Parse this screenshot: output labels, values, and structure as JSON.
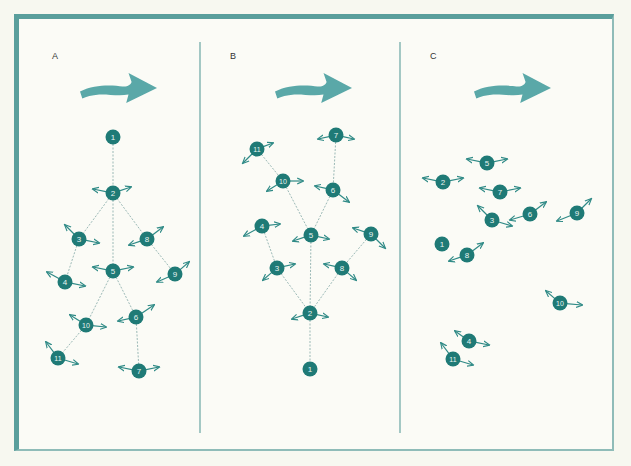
{
  "colors": {
    "frame": "#5a9f9c",
    "divider": "#6aa6a3",
    "flow_arrow": "#5aa8a8",
    "node": "#1f7a76",
    "node_text": "#e8f4f2",
    "edge": "#9bb9b6",
    "vector": "#2f8a86"
  },
  "panels": [
    {
      "label": "A",
      "label_pos": [
        52,
        51
      ],
      "flow_arrow": {
        "x": 80,
        "y": 73,
        "w": 77,
        "h": 30
      },
      "nodes": [
        {
          "id": "1",
          "x": 113,
          "y": 137,
          "arrows": []
        },
        {
          "id": "2",
          "x": 113,
          "y": 193,
          "arrows": [
            [
              -20,
              -4
            ],
            [
              18,
              -6
            ]
          ]
        },
        {
          "id": "3",
          "x": 79,
          "y": 239,
          "arrows": [
            [
              -14,
              -14
            ],
            [
              20,
              4
            ]
          ]
        },
        {
          "id": "8",
          "x": 147,
          "y": 239,
          "arrows": [
            [
              16,
              -12
            ],
            [
              -18,
              6
            ]
          ]
        },
        {
          "id": "5",
          "x": 113,
          "y": 271,
          "arrows": [
            [
              -20,
              -4
            ],
            [
              20,
              -4
            ]
          ]
        },
        {
          "id": "4",
          "x": 65,
          "y": 282,
          "arrows": [
            [
              -18,
              -10
            ],
            [
              20,
              4
            ]
          ]
        },
        {
          "id": "9",
          "x": 175,
          "y": 274,
          "arrows": [
            [
              14,
              -12
            ],
            [
              -18,
              8
            ]
          ]
        },
        {
          "id": "10",
          "x": 86,
          "y": 325,
          "arrows": [
            [
              -16,
              -10
            ],
            [
              20,
              2
            ]
          ]
        },
        {
          "id": "6",
          "x": 136,
          "y": 317,
          "arrows": [
            [
              18,
              -12
            ],
            [
              -18,
              4
            ]
          ]
        },
        {
          "id": "11",
          "x": 58,
          "y": 358,
          "arrows": [
            [
              -12,
              -16
            ],
            [
              20,
              6
            ]
          ]
        },
        {
          "id": "7",
          "x": 139,
          "y": 371,
          "arrows": [
            [
              -20,
              -4
            ],
            [
              20,
              -4
            ]
          ]
        }
      ],
      "edges": [
        [
          "1",
          "2"
        ],
        [
          "2",
          "3"
        ],
        [
          "2",
          "8"
        ],
        [
          "2",
          "5"
        ],
        [
          "3",
          "4"
        ],
        [
          "8",
          "9"
        ],
        [
          "5",
          "10"
        ],
        [
          "5",
          "6"
        ],
        [
          "10",
          "11"
        ],
        [
          "6",
          "7"
        ]
      ]
    },
    {
      "label": "B",
      "label_pos": [
        230,
        51
      ],
      "flow_arrow": {
        "x": 275,
        "y": 73,
        "w": 77,
        "h": 30
      },
      "nodes": [
        {
          "id": "7",
          "x": 336,
          "y": 135,
          "arrows": [
            [
              -18,
              4
            ],
            [
              18,
              4
            ]
          ]
        },
        {
          "id": "11",
          "x": 257,
          "y": 149,
          "arrows": [
            [
              16,
              -6
            ],
            [
              -14,
              14
            ]
          ]
        },
        {
          "id": "10",
          "x": 283,
          "y": 181,
          "arrows": [
            [
              20,
              0
            ],
            [
              -16,
              10
            ]
          ]
        },
        {
          "id": "6",
          "x": 333,
          "y": 190,
          "arrows": [
            [
              -18,
              -4
            ],
            [
              16,
              12
            ]
          ]
        },
        {
          "id": "4",
          "x": 262,
          "y": 226,
          "arrows": [
            [
              18,
              -2
            ],
            [
              -18,
              10
            ]
          ]
        },
        {
          "id": "5",
          "x": 311,
          "y": 235,
          "arrows": [
            [
              -18,
              6
            ],
            [
              18,
              4
            ]
          ]
        },
        {
          "id": "9",
          "x": 371,
          "y": 234,
          "arrows": [
            [
              -18,
              -6
            ],
            [
              14,
              14
            ]
          ]
        },
        {
          "id": "3",
          "x": 277,
          "y": 268,
          "arrows": [
            [
              18,
              -4
            ],
            [
              -14,
              12
            ]
          ]
        },
        {
          "id": "8",
          "x": 342,
          "y": 268,
          "arrows": [
            [
              -18,
              -4
            ],
            [
              14,
              12
            ]
          ]
        },
        {
          "id": "2",
          "x": 310,
          "y": 313,
          "arrows": [
            [
              -18,
              6
            ],
            [
              18,
              4
            ]
          ]
        },
        {
          "id": "1",
          "x": 310,
          "y": 369,
          "arrows": []
        }
      ],
      "edges": [
        [
          "7",
          "6"
        ],
        [
          "11",
          "10"
        ],
        [
          "10",
          "5"
        ],
        [
          "6",
          "5"
        ],
        [
          "4",
          "3"
        ],
        [
          "9",
          "8"
        ],
        [
          "5",
          "2"
        ],
        [
          "3",
          "2"
        ],
        [
          "8",
          "2"
        ],
        [
          "2",
          "1"
        ]
      ]
    },
    {
      "label": "C",
      "label_pos": [
        430,
        51
      ],
      "flow_arrow": {
        "x": 474,
        "y": 73,
        "w": 77,
        "h": 30
      },
      "nodes": [
        {
          "id": "5",
          "x": 487,
          "y": 163,
          "arrows": [
            [
              -20,
              -4
            ],
            [
              20,
              -4
            ]
          ]
        },
        {
          "id": "2",
          "x": 443,
          "y": 182,
          "arrows": [
            [
              -20,
              -4
            ],
            [
              20,
              -4
            ]
          ]
        },
        {
          "id": "7",
          "x": 500,
          "y": 192,
          "arrows": [
            [
              -20,
              -4
            ],
            [
              20,
              -4
            ]
          ]
        },
        {
          "id": "3",
          "x": 492,
          "y": 220,
          "arrows": [
            [
              -14,
              -14
            ],
            [
              20,
              6
            ]
          ]
        },
        {
          "id": "6",
          "x": 530,
          "y": 214,
          "arrows": [
            [
              -20,
              6
            ],
            [
              16,
              -12
            ]
          ]
        },
        {
          "id": "9",
          "x": 577,
          "y": 213,
          "arrows": [
            [
              -20,
              8
            ],
            [
              14,
              -14
            ]
          ]
        },
        {
          "id": "1",
          "x": 442,
          "y": 244,
          "arrows": []
        },
        {
          "id": "8",
          "x": 467,
          "y": 255,
          "arrows": [
            [
              -18,
              6
            ],
            [
              16,
              -12
            ]
          ]
        },
        {
          "id": "10",
          "x": 560,
          "y": 303,
          "arrows": [
            [
              -14,
              -12
            ],
            [
              22,
              2
            ]
          ]
        },
        {
          "id": "4",
          "x": 469,
          "y": 341,
          "arrows": [
            [
              -14,
              -10
            ],
            [
              20,
              4
            ]
          ]
        },
        {
          "id": "11",
          "x": 453,
          "y": 359,
          "arrows": [
            [
              -12,
              -16
            ],
            [
              20,
              6
            ]
          ]
        }
      ],
      "edges": []
    }
  ],
  "dividers": [
    {
      "x": 200,
      "y1": 42,
      "y2": 433
    },
    {
      "x": 400,
      "y1": 42,
      "y2": 433
    }
  ]
}
